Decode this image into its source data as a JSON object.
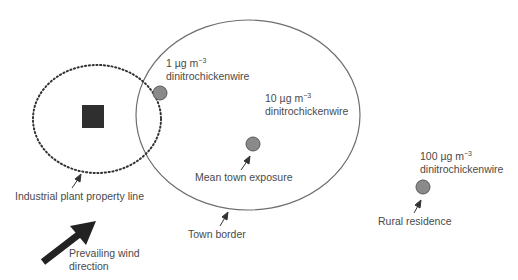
{
  "header_fragment": "",
  "colors": {
    "town_border": "#6e6e6e",
    "property_line": "#333333",
    "plant": "#2f2f2f",
    "receptor_fill": "#8a8a8a",
    "receptor_stroke": "#5a5a5a",
    "wind_arrow": "#222222",
    "text": "#4a4a4a"
  },
  "labels": {
    "receptor_1_conc": "1 µg m",
    "receptor_1_exp": "−3",
    "receptor_1_substance": "dinitrochickenwire",
    "receptor_2_conc": "10 µg m",
    "receptor_2_exp": "−3",
    "receptor_2_substance": "dinitrochickenwire",
    "receptor_3_conc": "100 µg m",
    "receptor_3_exp": "−3",
    "receptor_3_substance": "dinitrochickenwire",
    "mean_town_exposure": "Mean town exposure",
    "property_line": "Industrial plant property line",
    "town_border": "Town border",
    "rural_residence": "Rural residence",
    "wind_line1": "Prevailing wind",
    "wind_line2": "direction"
  },
  "diagram": {
    "nodes": [
      {
        "id": "plant",
        "shape": "square",
        "label": "Industrial plant"
      },
      {
        "id": "property-line",
        "shape": "dotted-ellipse",
        "label": "Industrial plant property line"
      },
      {
        "id": "town",
        "shape": "ellipse",
        "label": "Town border"
      },
      {
        "id": "receptor-1",
        "shape": "circle",
        "label": "1 µg m−3 dinitrochickenwire"
      },
      {
        "id": "receptor-2",
        "shape": "circle",
        "label": "10 µg m−3 dinitrochickenwire",
        "note": "Mean town exposure"
      },
      {
        "id": "receptor-3",
        "shape": "circle",
        "label": "100 µg m−3 dinitrochickenwire",
        "note": "Rural residence"
      },
      {
        "id": "wind",
        "shape": "arrow",
        "label": "Prevailing wind direction"
      }
    ]
  }
}
